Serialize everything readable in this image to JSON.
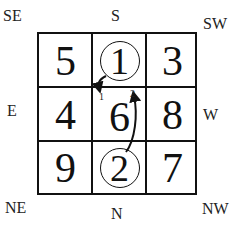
{
  "directions": {
    "top": "S",
    "bottom": "N",
    "left": "E",
    "right": "W",
    "top_left": "SE",
    "top_right": "SW",
    "bottom_left": "NE",
    "bottom_right": "NW"
  },
  "grid": {
    "rows": [
      [
        {
          "value": "5",
          "circled": false
        },
        {
          "value": "1",
          "circled": true
        },
        {
          "value": "3",
          "circled": false
        }
      ],
      [
        {
          "value": "4",
          "circled": false
        },
        {
          "value": "6",
          "circled": false
        },
        {
          "value": "8",
          "circled": false
        }
      ],
      [
        {
          "value": "9",
          "circled": false
        },
        {
          "value": "2",
          "circled": true
        },
        {
          "value": "7",
          "circled": false
        }
      ]
    ]
  },
  "arrows": [
    {
      "label": "1",
      "from": "circled-1",
      "to": "center-cell-top-left"
    },
    {
      "label": "2",
      "from": "circled-2",
      "to": "center-cell-top-right"
    }
  ],
  "colors": {
    "line": "#111111",
    "background": "#ffffff"
  }
}
